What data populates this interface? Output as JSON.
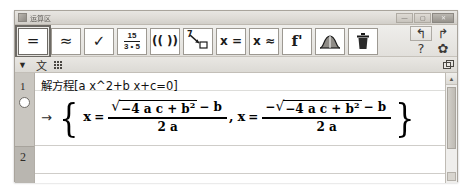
{
  "window": {
    "title": "运算区",
    "icon": "app-icon",
    "controls": {
      "minimize": "—",
      "maximize": "▢",
      "close": "✕"
    }
  },
  "toolbar": {
    "buttons": [
      {
        "name": "evaluate",
        "glyph": "=",
        "selected": true
      },
      {
        "name": "numeric",
        "glyph": "≈",
        "selected": false
      },
      {
        "name": "keep-input",
        "glyph": "✓",
        "selected": false
      },
      {
        "name": "factor",
        "numerator": "15",
        "denominator": "3 • 5",
        "selected": false
      },
      {
        "name": "expand",
        "glyph": "(( ))",
        "selected": false
      },
      {
        "name": "substitute",
        "glyph": "7",
        "selected": false
      },
      {
        "name": "solve",
        "glyph": "x =",
        "selected": false
      },
      {
        "name": "solve-numerically",
        "glyph": "x ≈",
        "selected": false
      },
      {
        "name": "derivative",
        "glyph": "f'",
        "selected": false
      },
      {
        "name": "integral",
        "glyph": "curve",
        "selected": false
      },
      {
        "name": "delete",
        "glyph": "trash",
        "selected": false
      }
    ],
    "undo": "↰",
    "redo": "↱",
    "help": "?",
    "settings": "✿"
  },
  "style_bar": {
    "caret": "▼",
    "text_button": "文",
    "grid_button": "matrix-grid",
    "window_button": "detach-window"
  },
  "cas": {
    "rows": [
      {
        "number": "1",
        "input": "解方程[a x^2+b x+c=0]",
        "arrow": "→",
        "output": {
          "open_brace": "{",
          "close_brace": "}",
          "solutions": [
            {
              "lhs": "x",
              "eq": "=",
              "numerator_sign": "",
              "radicand": "−4 a c + b",
              "radicand_exponent": "2",
              "numerator_tail": "− b",
              "denominator": "2 a"
            },
            {
              "lhs": "x",
              "eq": "=",
              "numerator_sign": "−",
              "radicand": "−4 a c + b",
              "radicand_exponent": "2",
              "numerator_tail": "− b",
              "denominator": "2 a"
            }
          ],
          "separator": ","
        },
        "visible_toggle": "visibility-circle"
      },
      {
        "number": "2",
        "input": "",
        "arrow": "",
        "output": null
      }
    ]
  },
  "scrollbar": {
    "up": "▲",
    "down": "▼"
  },
  "colors": {
    "window_chrome": "#d6d3ce",
    "toolbar": "#e8e6e2",
    "content": "#ffffff",
    "gutter": "#c9c6c0",
    "text": "#111111"
  }
}
